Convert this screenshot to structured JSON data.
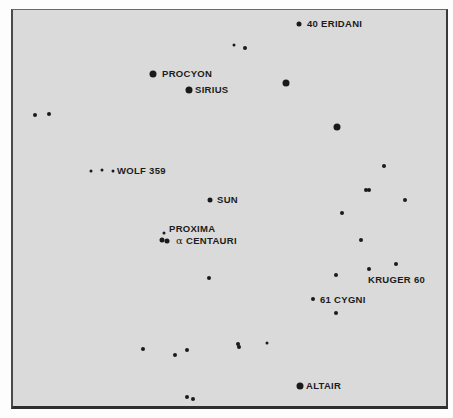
{
  "map": {
    "title": "",
    "background_color": "#dadada",
    "star_color": "#1a1a1a",
    "labeled_stars": [
      {
        "id": "40-eridani",
        "label": "40 ERIDANI",
        "x": 299,
        "y": 24,
        "size": "medium",
        "label_x": 307,
        "label_y": 19
      },
      {
        "id": "procyon",
        "label": "PROCYON",
        "x": 153,
        "y": 74,
        "size": "large",
        "label_x": 162,
        "label_y": 69
      },
      {
        "id": "sirius",
        "label": "SIRIUS",
        "x": 189,
        "y": 90,
        "size": "large",
        "label_x": 195,
        "label_y": 85
      },
      {
        "id": "wolf-359",
        "label": "WOLF 359",
        "x": 113,
        "y": 171,
        "size": "tiny",
        "label_x": 117,
        "label_y": 166
      },
      {
        "id": "sun",
        "label": "SUN",
        "x": 210,
        "y": 200,
        "size": "medium",
        "label_x": 217,
        "label_y": 195
      },
      {
        "id": "proxima",
        "label": "PROXIMA",
        "x": 164,
        "y": 233,
        "size": "tiny",
        "label_x": 169,
        "label_y": 224
      },
      {
        "id": "alpha-centauri",
        "label": "CENTAURI",
        "alpha_symbol": "α",
        "x": 167,
        "y": 241,
        "size": "medium",
        "label_x": 176,
        "label_y": 236
      },
      {
        "id": "kruger-60",
        "label": "KRUGER 60",
        "x": 369,
        "y": 269,
        "size": "small",
        "label_x": 368,
        "label_y": 275
      },
      {
        "id": "61-cygni",
        "label": "61 CYGNI",
        "x": 313,
        "y": 299,
        "size": "small",
        "label_x": 320,
        "label_y": 295
      },
      {
        "id": "altair",
        "label": "ALTAIR",
        "x": 300,
        "y": 386,
        "size": "large",
        "label_x": 306,
        "label_y": 381
      }
    ],
    "unlabeled_stars": [
      {
        "x": 234,
        "y": 45,
        "size": "tiny"
      },
      {
        "x": 245,
        "y": 48,
        "size": "small"
      },
      {
        "x": 286,
        "y": 83,
        "size": "large"
      },
      {
        "x": 35,
        "y": 115,
        "size": "small"
      },
      {
        "x": 49,
        "y": 114,
        "size": "small"
      },
      {
        "x": 337,
        "y": 127,
        "size": "large"
      },
      {
        "x": 91,
        "y": 171,
        "size": "tiny"
      },
      {
        "x": 102,
        "y": 170,
        "size": "tiny"
      },
      {
        "x": 384,
        "y": 166,
        "size": "small"
      },
      {
        "x": 366,
        "y": 190,
        "size": "small"
      },
      {
        "x": 369,
        "y": 190,
        "size": "small"
      },
      {
        "x": 405,
        "y": 200,
        "size": "small"
      },
      {
        "x": 342,
        "y": 213,
        "size": "small"
      },
      {
        "x": 361,
        "y": 240,
        "size": "small"
      },
      {
        "x": 162,
        "y": 240,
        "size": "medium"
      },
      {
        "x": 396,
        "y": 264,
        "size": "small"
      },
      {
        "x": 336,
        "y": 275,
        "size": "small"
      },
      {
        "x": 209,
        "y": 278,
        "size": "small"
      },
      {
        "x": 336,
        "y": 313,
        "size": "small"
      },
      {
        "x": 238,
        "y": 344,
        "size": "small"
      },
      {
        "x": 239,
        "y": 347,
        "size": "small"
      },
      {
        "x": 267,
        "y": 343,
        "size": "tiny"
      },
      {
        "x": 143,
        "y": 349,
        "size": "small"
      },
      {
        "x": 187,
        "y": 350,
        "size": "small"
      },
      {
        "x": 175,
        "y": 355,
        "size": "small"
      },
      {
        "x": 187,
        "y": 397,
        "size": "small"
      },
      {
        "x": 193,
        "y": 399,
        "size": "small"
      }
    ]
  }
}
